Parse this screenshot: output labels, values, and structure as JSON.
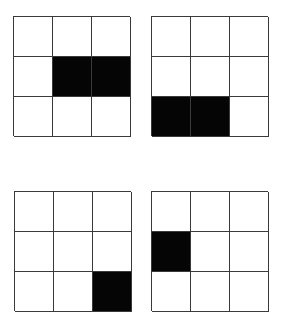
{
  "colors": {
    "filled": "#050505",
    "empty": "#ffffff",
    "line": "#3a3a3a"
  },
  "panels": [
    {
      "id": "top-left",
      "x": 13,
      "y": 16,
      "cells": [
        [
          0,
          0,
          0
        ],
        [
          0,
          1,
          1
        ],
        [
          0,
          0,
          0
        ]
      ]
    },
    {
      "id": "top-right",
      "x": 151,
      "y": 16,
      "cells": [
        [
          0,
          0,
          0
        ],
        [
          0,
          0,
          0
        ],
        [
          1,
          1,
          0
        ]
      ]
    },
    {
      "id": "bottom-left",
      "x": 14,
      "y": 191,
      "cells": [
        [
          0,
          0,
          0
        ],
        [
          0,
          0,
          0
        ],
        [
          0,
          0,
          1
        ]
      ]
    },
    {
      "id": "bottom-right",
      "x": 151,
      "y": 191,
      "cells": [
        [
          0,
          0,
          0
        ],
        [
          1,
          0,
          0
        ],
        [
          0,
          0,
          0
        ]
      ]
    }
  ]
}
